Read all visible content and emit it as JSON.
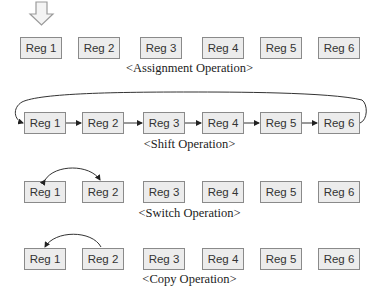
{
  "diagram": {
    "sections": [
      {
        "id": "assignment",
        "caption": "<Assignment Operation>",
        "registers": [
          "Reg 1",
          "Reg 2",
          "Reg 3",
          "Reg 4",
          "Reg 5",
          "Reg 6"
        ],
        "arrows": [
          {
            "type": "input-arrow",
            "into": "Reg 1"
          }
        ]
      },
      {
        "id": "shift",
        "caption": "<Shift Operation>",
        "registers": [
          "Reg 1",
          "Reg 2",
          "Reg 3",
          "Reg 4",
          "Reg 5",
          "Reg 6"
        ],
        "arrows": [
          {
            "from": "Reg 1",
            "to": "Reg 2"
          },
          {
            "from": "Reg 2",
            "to": "Reg 3"
          },
          {
            "from": "Reg 3",
            "to": "Reg 4"
          },
          {
            "from": "Reg 4",
            "to": "Reg 5"
          },
          {
            "from": "Reg 5",
            "to": "Reg 6"
          },
          {
            "from": "Reg 6",
            "to": "Reg 1",
            "type": "wraparound"
          }
        ]
      },
      {
        "id": "switch",
        "caption": "<Switch Operation>",
        "registers": [
          "Reg 1",
          "Reg 2",
          "Reg 3",
          "Reg 4",
          "Reg 5",
          "Reg 6"
        ],
        "arrows": [
          {
            "between": [
              "Reg 1",
              "Reg 2"
            ],
            "type": "bidirectional"
          }
        ]
      },
      {
        "id": "copy",
        "caption": "<Copy Operation>",
        "registers": [
          "Reg 1",
          "Reg 2",
          "Reg 3",
          "Reg 4",
          "Reg 5",
          "Reg 6"
        ],
        "arrows": [
          {
            "from": "Reg 2",
            "to": "Reg 1"
          }
        ]
      }
    ]
  }
}
